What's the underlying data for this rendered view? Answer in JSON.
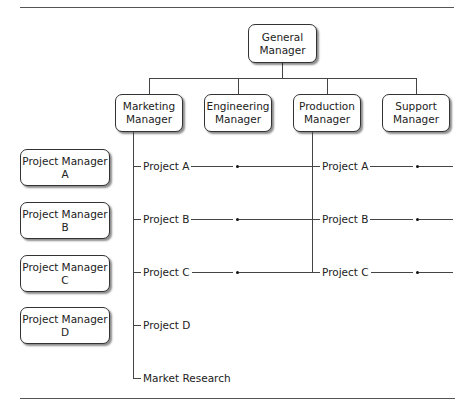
{
  "chart": {
    "general_manager": {
      "line1": "General",
      "line2": "Manager"
    },
    "managers": [
      {
        "line1": "Marketing",
        "line2": "Manager"
      },
      {
        "line1": "Engineering",
        "line2": "Manager"
      },
      {
        "line1": "Production",
        "line2": "Manager"
      },
      {
        "line1": "Support",
        "line2": "Manager"
      }
    ],
    "project_managers": [
      {
        "line1": "Project Manager",
        "line2": "A"
      },
      {
        "line1": "Project Manager",
        "line2": "B"
      },
      {
        "line1": "Project Manager",
        "line2": "C"
      },
      {
        "line1": "Project Manager",
        "line2": "D"
      }
    ],
    "marketing_projects": [
      "Project A",
      "Project B",
      "Project C",
      "Project D",
      "Market Research"
    ],
    "production_projects": [
      "Project A",
      "Project B",
      "Project C"
    ]
  }
}
